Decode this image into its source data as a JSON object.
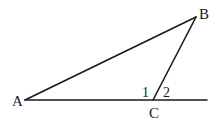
{
  "diagram": {
    "type": "geometry-triangle",
    "points": {
      "A": {
        "label": "A",
        "x": 25,
        "y": 100
      },
      "B": {
        "label": "B",
        "x": 196,
        "y": 17
      },
      "C": {
        "label": "C",
        "x": 153,
        "y": 100
      },
      "extension_end": {
        "x": 207,
        "y": 100
      }
    },
    "segments": [
      {
        "from": "A",
        "to": "B"
      },
      {
        "from": "B",
        "to": "C"
      },
      {
        "from": "A",
        "to": "extension_end"
      }
    ],
    "angle_labels": [
      {
        "id": "1",
        "label": "1",
        "at": "C",
        "meaning": "interior angle ACB"
      },
      {
        "id": "2",
        "label": "2",
        "at": "C",
        "meaning": "exterior angle at C"
      }
    ],
    "colors": {
      "stroke": "#1a1a1a",
      "background": "#ffffff"
    }
  }
}
